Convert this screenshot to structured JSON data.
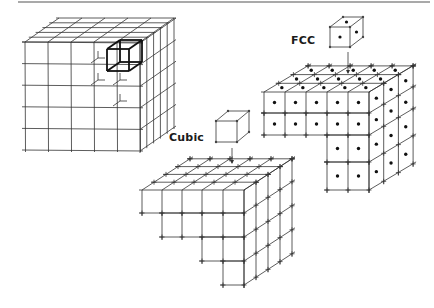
{
  "figure": {
    "top_rule": {
      "x1": 18,
      "x2": 430,
      "y": 2,
      "color": "#555555"
    },
    "labels": {
      "fcc": "FCC",
      "cubic": "Cubic"
    },
    "lattice_block": {
      "name": "full simple cubic lattice block",
      "origin": [
        25,
        42
      ],
      "cols": 5,
      "rows": 5,
      "depth": 5,
      "cell_dx": 23,
      "cell_dy": 21.6,
      "depth_step": [
        6.8,
        -4.8
      ],
      "highlight_cell": {
        "col": 3,
        "row": 0,
        "front_origin": [
          107,
          49
        ],
        "size": 22,
        "back_offset": [
          13,
          -9
        ]
      },
      "hidden_corner_marks": [
        [
          98,
          58
        ],
        [
          98,
          80
        ],
        [
          120,
          80
        ],
        [
          120,
          101
        ]
      ]
    },
    "unit_cells": {
      "cubic": {
        "front_origin": [
          216,
          121
        ],
        "size": 21,
        "back_offset": [
          12,
          -10
        ],
        "arrow": {
          "x": 232,
          "y1": 148,
          "y2": 163
        }
      },
      "fcc": {
        "front_origin": [
          330,
          27
        ],
        "size": 20,
        "back_offset": [
          13,
          -10
        ],
        "arrow": {
          "x": 348,
          "y1": 52,
          "y2": 73
        }
      }
    },
    "cubic_staircase": {
      "front_left": 142,
      "front_top": 190,
      "col_x": [
        142,
        162,
        182,
        202,
        223,
        244
      ],
      "row_y": [
        190,
        213,
        237,
        261,
        285
      ],
      "row_spans": [
        [
          0,
          5
        ],
        [
          1,
          5
        ],
        [
          3,
          5
        ],
        [
          4,
          5
        ]
      ],
      "depth": 4,
      "depth_step": [
        12,
        -7.8
      ],
      "right_rows": 4
    },
    "fcc_staircase": {
      "col_x": [
        264,
        285,
        306,
        327,
        348,
        369
      ],
      "row_y": [
        92,
        113,
        135,
        162,
        190
      ],
      "row_spans": [
        [
          0,
          5
        ],
        [
          0,
          5
        ],
        [
          3,
          5
        ],
        [
          3,
          5
        ]
      ],
      "depth": 3,
      "depth_step": [
        14.7,
        -8.7
      ],
      "right_rows": 4
    }
  }
}
